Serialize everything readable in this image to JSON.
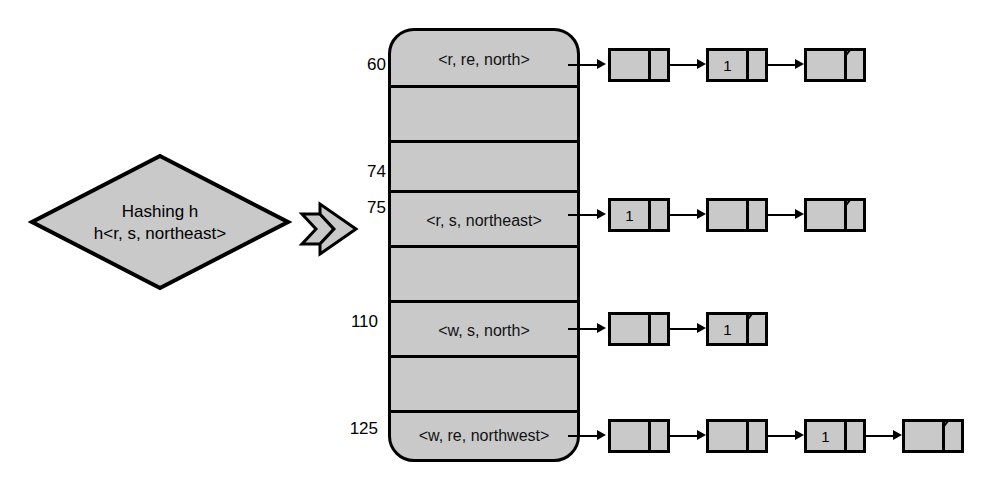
{
  "diagram": {
    "colors": {
      "fill": "#c9c9c9",
      "stroke": "#000000",
      "background": "#ffffff"
    },
    "hash_node": {
      "line1": "Hashing h",
      "line2": "h<r, s, northeast>"
    },
    "table": {
      "slots": [
        {
          "index": "60",
          "value": "<r, re, north>",
          "has_chain": true
        },
        {
          "index": "",
          "value": "",
          "has_chain": false
        },
        {
          "index": "74",
          "value": "",
          "has_chain": false
        },
        {
          "index": "75",
          "value": "<r, s, northeast>",
          "has_chain": true
        },
        {
          "index": "",
          "value": "",
          "has_chain": false
        },
        {
          "index": "110",
          "value": "<w, s, north>",
          "has_chain": true
        },
        {
          "index": "",
          "value": "",
          "has_chain": false
        },
        {
          "index": "125",
          "value": "<w, re, northwest>",
          "has_chain": true
        }
      ]
    },
    "chains": [
      {
        "slot_index": "60",
        "nodes": [
          {
            "value": "",
            "null_pointer": false
          },
          {
            "value": "1",
            "null_pointer": false
          },
          {
            "value": "",
            "null_pointer": true
          }
        ]
      },
      {
        "slot_index": "75",
        "nodes": [
          {
            "value": "1",
            "null_pointer": false
          },
          {
            "value": "",
            "null_pointer": false
          },
          {
            "value": "",
            "null_pointer": true
          }
        ]
      },
      {
        "slot_index": "110",
        "nodes": [
          {
            "value": "",
            "null_pointer": false
          },
          {
            "value": "1",
            "null_pointer": true
          }
        ]
      },
      {
        "slot_index": "125",
        "nodes": [
          {
            "value": "",
            "null_pointer": false
          },
          {
            "value": "",
            "null_pointer": false
          },
          {
            "value": "1",
            "null_pointer": false
          },
          {
            "value": "",
            "null_pointer": true
          }
        ]
      }
    ]
  }
}
